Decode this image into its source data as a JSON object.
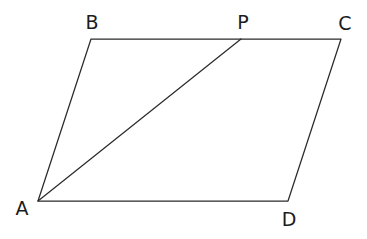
{
  "figure": {
    "kind": "geometry-diagram",
    "background_color": "#ffffff",
    "stroke_color": "#2b2b2b",
    "label_color": "#1c1c1c",
    "canvas": {
      "width": 367,
      "height": 239
    },
    "vertices": [
      {
        "id": "A",
        "label": "A",
        "x": 38,
        "y": 201,
        "label_x": 22,
        "label_y": 208
      },
      {
        "id": "B",
        "label": "B",
        "x": 91,
        "y": 39,
        "label_x": 92,
        "label_y": 22
      },
      {
        "id": "P",
        "label": "P",
        "x": 241,
        "y": 39,
        "label_x": 243,
        "label_y": 22
      },
      {
        "id": "C",
        "label": "C",
        "x": 341,
        "y": 39,
        "label_x": 345,
        "label_y": 23
      },
      {
        "id": "D",
        "label": "D",
        "x": 288,
        "y": 201,
        "label_x": 289,
        "label_y": 219
      }
    ],
    "edges": [
      {
        "id": "AB",
        "from": "A",
        "to": "B",
        "kind": "side"
      },
      {
        "id": "BC",
        "from": "B",
        "to": "C",
        "kind": "side"
      },
      {
        "id": "CD",
        "from": "C",
        "to": "D",
        "kind": "side"
      },
      {
        "id": "DA",
        "from": "D",
        "to": "A",
        "kind": "side"
      },
      {
        "id": "AP",
        "from": "A",
        "to": "P",
        "kind": "diagonal"
      }
    ],
    "outline_path": "M 38 201 L 91 39 L 341 39 L 288 201 Z",
    "diagonal_path": "M 38 201 L 241 39"
  }
}
